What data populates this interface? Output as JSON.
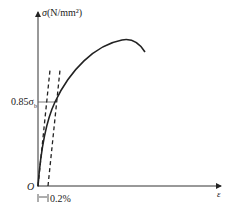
{
  "diagram": {
    "y_axis_label": "σ(N/mm²)",
    "y_axis_symbol": "σ",
    "y_axis_unit": "(N/mm²)",
    "x_axis_symbol": "ε",
    "origin_label": "O",
    "level_label": "0.85σ",
    "level_subscript": "b",
    "offset_label": "0.2%",
    "colors": {
      "line": "#222222",
      "background": "#ffffff"
    }
  }
}
